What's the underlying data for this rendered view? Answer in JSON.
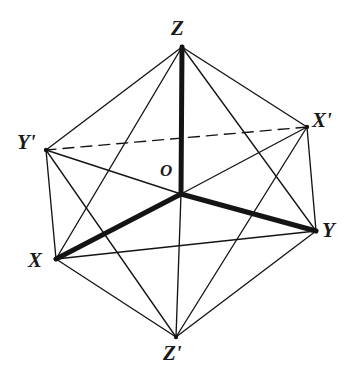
{
  "figure": {
    "kind": "line-diagram",
    "shape_name": "octahedron",
    "background_color": "#ffffff",
    "ink_color": "#141414",
    "width": 353,
    "height": 377
  },
  "labels": {
    "z": "Z",
    "z_prime": "Z'",
    "x": "X",
    "x_prime": "X'",
    "y": "Y",
    "y_prime": "Y'",
    "origin": "O"
  },
  "vertices": [
    {
      "name": "Z",
      "label": "Z",
      "x": 182,
      "y": 47,
      "label_x": 171,
      "label_y": 18
    },
    {
      "name": "Y'",
      "label": "Y'",
      "x": 46,
      "y": 150,
      "label_x": 17,
      "label_y": 132
    },
    {
      "name": "X'",
      "label": "X'",
      "x": 307,
      "y": 127,
      "label_x": 312,
      "label_y": 110
    },
    {
      "name": "X",
      "label": "X",
      "x": 56,
      "y": 259,
      "label_x": 28,
      "label_y": 250
    },
    {
      "name": "Y",
      "label": "Y",
      "x": 316,
      "y": 231,
      "label_x": 322,
      "label_y": 220
    },
    {
      "name": "Z'",
      "label": "Z'",
      "x": 176,
      "y": 337,
      "label_x": 163,
      "label_y": 343
    },
    {
      "name": "O",
      "label": "O",
      "x": 181,
      "y": 194,
      "label_x": 160,
      "label_y": 162
    }
  ],
  "edges": [
    {
      "from": "Z",
      "to": "Y'",
      "style": "solid",
      "weight": "thin"
    },
    {
      "from": "Z",
      "to": "X'",
      "style": "solid",
      "weight": "thin"
    },
    {
      "from": "Z",
      "to": "X",
      "style": "solid",
      "weight": "thin"
    },
    {
      "from": "Z",
      "to": "Y",
      "style": "solid",
      "weight": "thin"
    },
    {
      "from": "Z'",
      "to": "Y'",
      "style": "solid",
      "weight": "thin"
    },
    {
      "from": "Z'",
      "to": "X'",
      "style": "solid",
      "weight": "thin"
    },
    {
      "from": "Z'",
      "to": "X",
      "style": "solid",
      "weight": "thin"
    },
    {
      "from": "Z'",
      "to": "Y",
      "style": "solid",
      "weight": "thin"
    },
    {
      "from": "Y'",
      "to": "X",
      "style": "solid",
      "weight": "thin"
    },
    {
      "from": "X",
      "to": "Y",
      "style": "solid",
      "weight": "thin"
    },
    {
      "from": "Y",
      "to": "X'",
      "style": "solid",
      "weight": "thin"
    },
    {
      "from": "X'",
      "to": "Y'",
      "style": "dashed",
      "weight": "thin"
    }
  ],
  "axes": [
    {
      "from": "O",
      "to": "Z",
      "style": "solid",
      "weight": "bold"
    },
    {
      "from": "O",
      "to": "X",
      "style": "solid",
      "weight": "bold"
    },
    {
      "from": "O",
      "to": "Y",
      "style": "solid",
      "weight": "bold"
    },
    {
      "from": "O",
      "to": "Z'",
      "style": "solid",
      "weight": "thin"
    },
    {
      "from": "O",
      "to": "X'",
      "style": "solid",
      "weight": "thin"
    },
    {
      "from": "O",
      "to": "Y'",
      "style": "solid",
      "weight": "thin"
    }
  ]
}
